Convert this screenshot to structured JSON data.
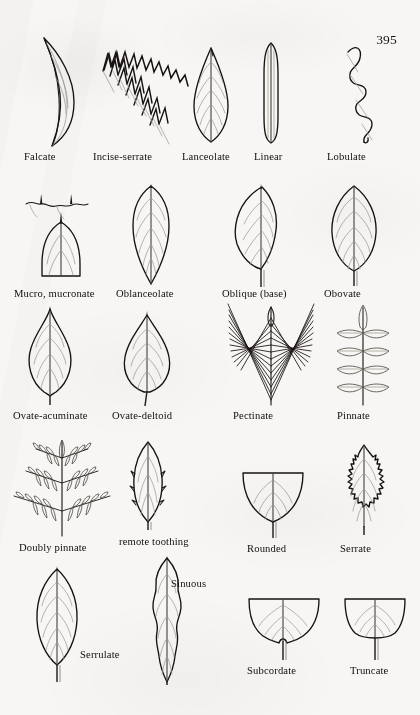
{
  "page": {
    "number": "395",
    "kind": "botanical-plate",
    "title_visible": false,
    "background_color": "#f7f6f4",
    "ink_color": "#17120f",
    "vein_color": "#9c968f"
  },
  "figures": [
    {
      "id": "falcate",
      "label": "Falcate",
      "row": 1,
      "col": 1
    },
    {
      "id": "incise-serrate",
      "label": "Incise-serrate",
      "row": 1,
      "col": 2
    },
    {
      "id": "lanceolate",
      "label": "Lanceolate",
      "row": 1,
      "col": 3
    },
    {
      "id": "linear",
      "label": "Linear",
      "row": 1,
      "col": 4
    },
    {
      "id": "lobulate",
      "label": "Lobulate",
      "row": 1,
      "col": 5
    },
    {
      "id": "mucro-mucronate",
      "label": "Mucro, mucronate",
      "row": 2,
      "col": 1
    },
    {
      "id": "oblanceolate",
      "label": "Oblanceolate",
      "row": 2,
      "col": 2
    },
    {
      "id": "oblique-base",
      "label": "Oblique (base)",
      "row": 2,
      "col": 3
    },
    {
      "id": "obovate",
      "label": "Obovate",
      "row": 2,
      "col": 4
    },
    {
      "id": "ovate-acuminate",
      "label": "Ovate-acuminate",
      "row": 3,
      "col": 1
    },
    {
      "id": "ovate-deltoid",
      "label": "Ovate-deltoid",
      "row": 3,
      "col": 2
    },
    {
      "id": "pectinate",
      "label": "Pectinate",
      "row": 3,
      "col": 3
    },
    {
      "id": "pinnate",
      "label": "Pinnate",
      "row": 3,
      "col": 4
    },
    {
      "id": "doubly-pinnate",
      "label": "Doubly pinnate",
      "row": 4,
      "col": 1
    },
    {
      "id": "remote-toothing",
      "label": "remote toothing",
      "row": 4,
      "col": 2
    },
    {
      "id": "rounded",
      "label": "Rounded",
      "row": 4,
      "col": 3
    },
    {
      "id": "serrate",
      "label": "Serrate",
      "row": 4,
      "col": 4
    },
    {
      "id": "serrulate",
      "label": "Serrulate",
      "row": 5,
      "col": 1
    },
    {
      "id": "sinuous",
      "label": "Sinuous",
      "row": 5,
      "col": 2
    },
    {
      "id": "subcordate",
      "label": "Subcordate",
      "row": 5,
      "col": 3
    },
    {
      "id": "truncate",
      "label": "Truncate",
      "row": 5,
      "col": 4
    }
  ]
}
